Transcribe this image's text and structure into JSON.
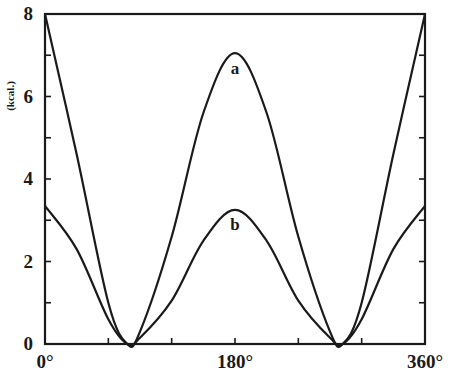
{
  "chart_data": {
    "type": "line",
    "title": "",
    "xlabel": "",
    "ylabel": "(kcal.)",
    "xlim": [
      0,
      360
    ],
    "ylim": [
      0,
      8
    ],
    "grid": false,
    "legend": "none (inline curve labels)",
    "x_ticks": [
      0,
      60,
      120,
      180,
      240,
      300,
      360
    ],
    "x_tick_labels": [
      "0°",
      "",
      "",
      "180°",
      "",
      "",
      "360°"
    ],
    "y_ticks": [
      0,
      1,
      2,
      3,
      4,
      5,
      6,
      7,
      8
    ],
    "y_tick_labels": [
      "0",
      "",
      "2",
      "",
      "4",
      "",
      "6",
      "",
      "8"
    ],
    "x": [
      0,
      30,
      60,
      78,
      90,
      120,
      150,
      180,
      210,
      240,
      270,
      282,
      300,
      330,
      360
    ],
    "series": [
      {
        "name": "a",
        "values": [
          8.0,
          4.6,
          1.0,
          0.0,
          0.3,
          2.6,
          5.6,
          7.05,
          5.6,
          2.6,
          0.3,
          0.0,
          1.0,
          4.6,
          8.0
        ]
      },
      {
        "name": "b",
        "values": [
          3.35,
          2.3,
          0.6,
          0.0,
          0.15,
          1.05,
          2.5,
          3.25,
          2.5,
          1.05,
          0.15,
          0.0,
          0.6,
          2.3,
          3.35
        ]
      }
    ],
    "annotations": [
      {
        "text": "a",
        "x": 180,
        "y": 6.7
      },
      {
        "text": "b",
        "x": 180,
        "y": 2.9
      }
    ]
  }
}
